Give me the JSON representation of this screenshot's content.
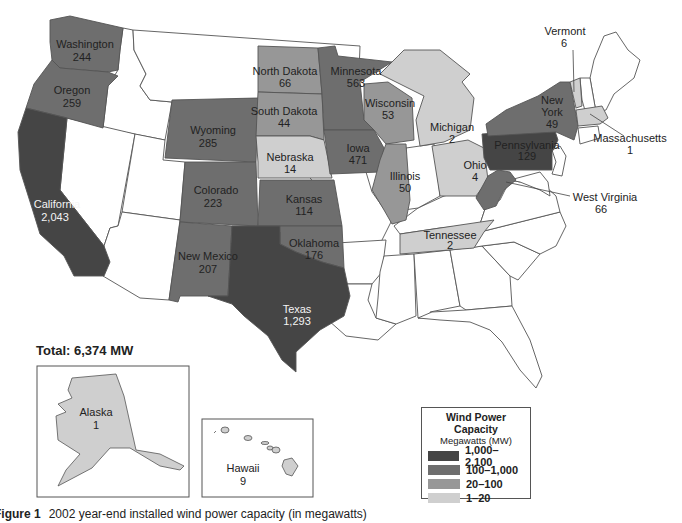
{
  "figure": {
    "total_label": "Total: 6,374 MW",
    "caption_prefix": "Figure 1",
    "caption_text": "2002 year-end installed wind power capacity (in megawatts)"
  },
  "legend": {
    "title": "Wind Power Capacity",
    "subtitle": "Megawatts (MW)",
    "items": [
      {
        "label": "1,000–2,100",
        "color": "#454545"
      },
      {
        "label": "100–1,000",
        "color": "#6e6e6e"
      },
      {
        "label": "20–100",
        "color": "#979797"
      },
      {
        "label": "1–20",
        "color": "#cfcfcf"
      }
    ]
  },
  "colors": {
    "none": "#ffffff",
    "tier4": "#454545",
    "tier3": "#6e6e6e",
    "tier2": "#979797",
    "tier1": "#cfcfcf",
    "border": "#555555"
  },
  "states": [
    {
      "name": "Washington",
      "value": "244"
    },
    {
      "name": "Oregon",
      "value": "259"
    },
    {
      "name": "California",
      "value": "2,043"
    },
    {
      "name": "Wyoming",
      "value": "285"
    },
    {
      "name": "Colorado",
      "value": "223"
    },
    {
      "name": "New Mexico",
      "value": "207"
    },
    {
      "name": "Texas",
      "value": "1,293"
    },
    {
      "name": "North Dakota",
      "value": "66"
    },
    {
      "name": "South Dakota",
      "value": "44"
    },
    {
      "name": "Nebraska",
      "value": "14"
    },
    {
      "name": "Kansas",
      "value": "114"
    },
    {
      "name": "Oklahoma",
      "value": "176"
    },
    {
      "name": "Minnesota",
      "value": "563"
    },
    {
      "name": "Iowa",
      "value": "471"
    },
    {
      "name": "Wisconsin",
      "value": "53"
    },
    {
      "name": "Illinois",
      "value": "50"
    },
    {
      "name": "Michigan",
      "value": "2"
    },
    {
      "name": "Ohio",
      "value": "4"
    },
    {
      "name": "Tennessee",
      "value": "2"
    },
    {
      "name": "Pennsylvania",
      "value": "129"
    },
    {
      "name": "New York",
      "value": "49"
    },
    {
      "name": "Vermont",
      "value": "6"
    },
    {
      "name": "Massachusetts",
      "value": "1"
    },
    {
      "name": "West Virginia",
      "value": "66"
    },
    {
      "name": "Alaska",
      "value": "1"
    },
    {
      "name": "Hawaii",
      "value": "9"
    }
  ],
  "chart_data": {
    "type": "choropleth-map",
    "title": "Wind Power Capacity",
    "subtitle": "Megawatts (MW)",
    "total": "6,374 MW",
    "caption": "Figure 1 2002 year-end installed wind power capacity (in megawatts)",
    "bins": [
      {
        "label": "1,000–2,100",
        "min": 1000,
        "max": 2100
      },
      {
        "label": "100–1,000",
        "min": 100,
        "max": 1000
      },
      {
        "label": "20–100",
        "min": 20,
        "max": 100
      },
      {
        "label": "1–20",
        "min": 1,
        "max": 20
      }
    ],
    "categories": [
      "California",
      "Texas",
      "Minnesota",
      "Iowa",
      "Wyoming",
      "Oregon",
      "Washington",
      "Colorado",
      "New Mexico",
      "Oklahoma",
      "Pennsylvania",
      "Kansas",
      "North Dakota",
      "West Virginia",
      "Wisconsin",
      "Illinois",
      "New York",
      "South Dakota",
      "Nebraska",
      "Hawaii",
      "Vermont",
      "Ohio",
      "Michigan",
      "Tennessee",
      "Alaska",
      "Massachusetts"
    ],
    "values": [
      2043,
      1293,
      563,
      471,
      285,
      259,
      244,
      223,
      207,
      176,
      129,
      114,
      66,
      66,
      53,
      50,
      49,
      44,
      14,
      9,
      6,
      4,
      2,
      2,
      1,
      1
    ],
    "legend_position": "bottom-right"
  }
}
